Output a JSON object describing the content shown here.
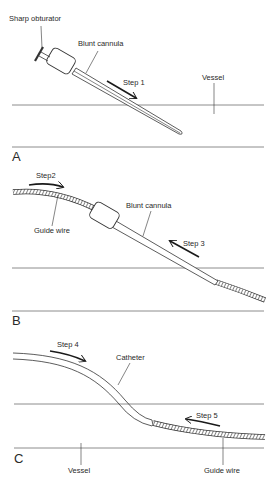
{
  "figure": {
    "panels": [
      {
        "id": "A",
        "letter": "A",
        "labels": {
          "obturator": "Sharp obturator",
          "cannula": "Blunt cannula",
          "step": "Step 1",
          "vessel": "Vessel"
        }
      },
      {
        "id": "B",
        "letter": "B",
        "labels": {
          "step_wire": "Step2",
          "guide_wire": "Guide wire",
          "cannula": "Blunt cannula",
          "step_cannula": "Step 3"
        }
      },
      {
        "id": "C",
        "letter": "C",
        "labels": {
          "step_catheter": "Step 4",
          "catheter": "Catheter",
          "step_wire": "Step 5",
          "vessel": "Vessel",
          "guide_wire": "Guide wire"
        }
      }
    ],
    "colors": {
      "line": "#333333",
      "vessel_wall": "#6e6e6e",
      "arrow": "#1a1a1a",
      "background": "#ffffff"
    }
  }
}
